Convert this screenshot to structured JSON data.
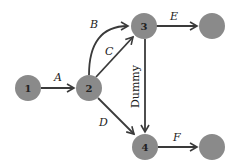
{
  "diagram": {
    "type": "activity-on-arrow network",
    "colors": {
      "node": "#8a8a8a",
      "edge": "#3a3a3a",
      "text": "#222222"
    },
    "nodes": [
      {
        "id": "1",
        "label": "1"
      },
      {
        "id": "2",
        "label": "2"
      },
      {
        "id": "3",
        "label": "3"
      },
      {
        "id": "4",
        "label": "4"
      },
      {
        "id": "5",
        "label": ""
      },
      {
        "id": "6",
        "label": ""
      }
    ],
    "edges": [
      {
        "from": "1",
        "to": "2",
        "label": "A"
      },
      {
        "from": "2",
        "to": "3",
        "label": "B"
      },
      {
        "from": "2",
        "to": "3",
        "label": "C"
      },
      {
        "from": "2",
        "to": "4",
        "label": "D"
      },
      {
        "from": "3",
        "to": "5",
        "label": "E"
      },
      {
        "from": "4",
        "to": "6",
        "label": "F"
      },
      {
        "from": "3",
        "to": "4",
        "label": "Dummy"
      }
    ]
  }
}
